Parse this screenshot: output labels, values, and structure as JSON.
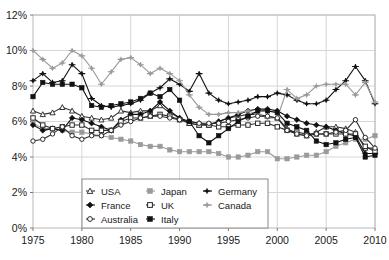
{
  "chart_data": {
    "type": "line",
    "title": "",
    "xlabel": "",
    "ylabel": "",
    "xlim": [
      1975,
      2010
    ],
    "ylim": [
      0,
      12
    ],
    "grid": true,
    "y_tick_labels": [
      "0%",
      "2%",
      "4%",
      "6%",
      "8%",
      "10%",
      "12%"
    ],
    "y_tick_values": [
      0,
      2,
      4,
      6,
      8,
      10,
      12
    ],
    "x_tick_labels": [
      "1975",
      "1980",
      "1985",
      "1990",
      "1995",
      "2000",
      "2005",
      "2010"
    ],
    "x_tick_values": [
      1975,
      1980,
      1985,
      1990,
      1995,
      2000,
      2005,
      2010
    ],
    "x": [
      1975,
      1976,
      1977,
      1978,
      1979,
      1980,
      1981,
      1982,
      1983,
      1984,
      1985,
      1986,
      1987,
      1988,
      1989,
      1990,
      1991,
      1992,
      1993,
      1994,
      1995,
      1996,
      1997,
      1998,
      1999,
      2000,
      2001,
      2002,
      2003,
      2004,
      2005,
      2006,
      2007,
      2008,
      2009,
      2010
    ],
    "legend_position": "inside-bottom-center",
    "series": [
      {
        "name": "USA",
        "color": "#333333",
        "marker": "triangle-open",
        "values": [
          6.6,
          6.4,
          6.5,
          6.8,
          6.6,
          6.3,
          6.2,
          6.1,
          6.2,
          6.6,
          6.5,
          6.6,
          6.6,
          6.9,
          6.5,
          6.2,
          5.9,
          5.8,
          5.8,
          6.0,
          6.2,
          6.3,
          6.4,
          6.4,
          6.3,
          6.2,
          5.6,
          5.3,
          5.2,
          5.4,
          5.7,
          5.7,
          5.6,
          5.4,
          4.5,
          4.5
        ]
      },
      {
        "name": "Japan",
        "color": "#9a9a9a",
        "marker": "square-gray",
        "values": [
          5.9,
          5.6,
          5.6,
          5.5,
          5.4,
          5.4,
          5.3,
          5.2,
          5.1,
          5.0,
          4.9,
          4.7,
          4.6,
          4.6,
          4.4,
          4.3,
          4.3,
          4.3,
          4.3,
          4.2,
          4.0,
          4.0,
          4.1,
          4.3,
          4.3,
          3.9,
          3.9,
          4.0,
          4.1,
          4.1,
          4.3,
          4.6,
          4.8,
          5.0,
          5.0,
          5.2
        ]
      },
      {
        "name": "Germany",
        "color": "#111111",
        "marker": "star",
        "values": [
          8.3,
          8.7,
          8.2,
          8.3,
          9.2,
          8.7,
          7.3,
          6.9,
          6.8,
          6.9,
          7.0,
          7.2,
          7.6,
          7.9,
          8.4,
          8.1,
          7.7,
          8.7,
          7.6,
          7.2,
          7.0,
          7.1,
          7.2,
          7.4,
          7.4,
          7.6,
          7.5,
          7.2,
          7.0,
          7.0,
          7.2,
          7.8,
          8.3,
          9.1,
          8.3,
          7.0
        ]
      },
      {
        "name": "France",
        "color": "#111111",
        "marker": "diamond",
        "values": [
          5.8,
          5.5,
          5.6,
          5.5,
          6.2,
          6.1,
          5.9,
          5.7,
          5.5,
          6.1,
          6.4,
          6.4,
          6.6,
          7.1,
          6.6,
          6.2,
          6.0,
          5.9,
          5.8,
          6.0,
          6.2,
          6.4,
          6.6,
          6.7,
          6.7,
          6.6,
          6.3,
          6.1,
          5.9,
          5.8,
          5.7,
          5.5,
          5.3,
          5.2,
          4.2,
          4.2
        ]
      },
      {
        "name": "UK",
        "color": "#2a2a2a",
        "marker": "square-open",
        "values": [
          6.2,
          5.8,
          5.6,
          5.7,
          5.8,
          5.8,
          5.5,
          5.5,
          5.5,
          6.0,
          6.2,
          6.2,
          6.3,
          6.4,
          6.3,
          6.1,
          5.9,
          5.8,
          5.8,
          5.7,
          5.7,
          5.8,
          5.8,
          5.9,
          5.9,
          5.7,
          5.5,
          5.4,
          5.3,
          5.3,
          5.3,
          5.3,
          5.3,
          5.3,
          4.6,
          4.3
        ]
      },
      {
        "name": "Canada",
        "color": "#9a9a9a",
        "marker": "star-gray",
        "values": [
          10.0,
          9.5,
          9.0,
          9.3,
          10.0,
          9.7,
          9.0,
          8.1,
          8.8,
          9.5,
          9.6,
          9.2,
          8.7,
          9.0,
          8.7,
          8.3,
          7.5,
          6.8,
          6.4,
          6.4,
          6.5,
          6.5,
          6.6,
          6.4,
          6.2,
          6.2,
          7.8,
          7.3,
          7.5,
          8.0,
          8.1,
          8.1,
          8.1,
          7.5,
          8.2,
          7.1
        ]
      },
      {
        "name": "Australia",
        "color": "#2a2a2a",
        "marker": "circle-open",
        "values": [
          4.9,
          5.0,
          5.3,
          5.7,
          5.2,
          5.0,
          5.2,
          5.2,
          5.5,
          5.8,
          6.0,
          6.2,
          6.3,
          6.3,
          6.2,
          6.1,
          6.0,
          5.9,
          5.9,
          5.9,
          6.0,
          6.1,
          6.2,
          6.3,
          6.3,
          6.2,
          5.5,
          5.3,
          5.2,
          5.3,
          5.3,
          5.4,
          5.5,
          6.1,
          5.1,
          4.5
        ]
      },
      {
        "name": "Italy",
        "color": "#111111",
        "marker": "square-filled",
        "values": [
          7.4,
          8.2,
          8.1,
          8.1,
          8.1,
          7.9,
          6.9,
          6.8,
          6.9,
          7.0,
          7.1,
          7.3,
          7.6,
          7.4,
          7.8,
          7.2,
          6.0,
          5.2,
          4.8,
          5.2,
          5.6,
          6.0,
          6.3,
          6.6,
          6.6,
          6.5,
          5.9,
          5.7,
          5.5,
          4.9,
          4.7,
          4.8,
          5.0,
          5.1,
          4.0,
          4.1
        ]
      }
    ]
  },
  "legend": {
    "entries": [
      {
        "label": "USA"
      },
      {
        "label": "Japan"
      },
      {
        "label": "Germany"
      },
      {
        "label": "France"
      },
      {
        "label": "UK"
      },
      {
        "label": "Canada"
      },
      {
        "label": "Australia"
      },
      {
        "label": "Italy"
      }
    ]
  }
}
